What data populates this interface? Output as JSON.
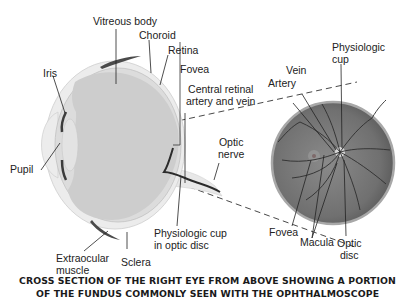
{
  "diagram": {
    "labels": {
      "vitreous_body": "Vitreous body",
      "choroid": "Choroid",
      "retina": "Retina",
      "fovea_cross": "Fovea",
      "iris": "Iris",
      "central_retinal": [
        "Central retinal",
        "artery and vein"
      ],
      "pupil": "Pupil",
      "optic_nerve": [
        "Optic",
        "nerve"
      ],
      "physiologic_cup_disc": [
        "Physiologic cup",
        "in optic disc"
      ],
      "extraocular_muscle": [
        "Extraocular",
        "muscle"
      ],
      "sclera": "Sclera",
      "vein": "Vein",
      "artery": "Artery",
      "physiologic_cup": [
        "Physiologic",
        "cup"
      ],
      "fovea_fundus": "Fovea",
      "macula": "Macula",
      "optic_disc": [
        "Optic",
        "disc"
      ]
    },
    "caption": [
      "CROSS SECTION OF THE RIGHT EYE FROM ABOVE SHOWING A PORTION",
      "OF THE FUNDUS COMMONLY SEEN WITH THE OPHTHALMOSCOPE"
    ],
    "colors": {
      "eye_fill": "#cfcfcf",
      "sclera": "#e6e6e6",
      "muscle": "#4a4a4a",
      "fundus": "#7a7a7a",
      "fundus_rim": "#9a9a9a",
      "vessel": "#2e2e2e"
    }
  }
}
